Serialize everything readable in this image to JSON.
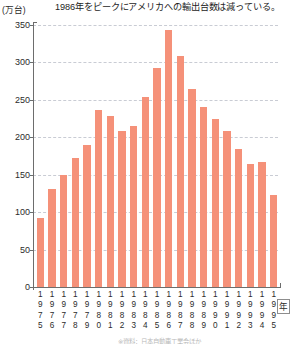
{
  "chart_data": {
    "type": "bar",
    "title": "1986年をピークにアメリカへの輸出台数は減っている。",
    "xlabel": "年",
    "ylabel": "(万台)",
    "unit": "(万台)",
    "ylim": [
      0,
      350
    ],
    "ytick_step": 50,
    "yticks": [
      0,
      50,
      100,
      150,
      200,
      250,
      300,
      350
    ],
    "ytick_labels": [
      "0",
      "50",
      "100",
      "150",
      "200",
      "250",
      "300",
      "350"
    ],
    "grid": "horizontal-dashed",
    "legend": "none",
    "bar_color": "#f59179",
    "categories": [
      "1975",
      "1976",
      "1977",
      "1978",
      "1979",
      "1980",
      "1981",
      "1982",
      "1983",
      "1984",
      "1985",
      "1986",
      "1987",
      "1988",
      "1989",
      "1990",
      "1991",
      "1992",
      "1993",
      "1994",
      "1995"
    ],
    "values": [
      92,
      131,
      150,
      173,
      190,
      237,
      228,
      208,
      215,
      254,
      292,
      343,
      308,
      265,
      240,
      224,
      209,
      185,
      165,
      167,
      123
    ],
    "annotation": "1986年がピーク",
    "source_note": "※資料：日本自動車工業会ほか"
  },
  "axis": {
    "year_suffix": "年"
  }
}
